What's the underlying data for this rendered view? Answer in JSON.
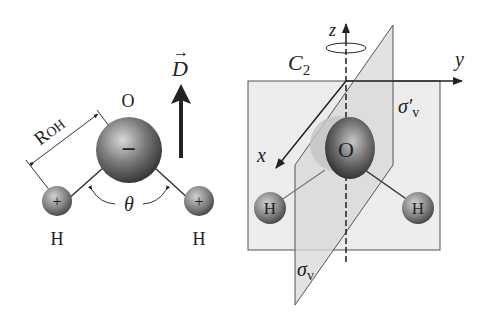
{
  "left_diagram": {
    "oxygen_label": "O",
    "oxygen_charge": "−",
    "hydrogen_left_label": "H",
    "hydrogen_right_label": "H",
    "hydrogen_charge": "+",
    "bond_length_label": "R",
    "bond_length_sub": "OH",
    "angle_label": "θ",
    "dipole_label": "D",
    "dipole_arrow": "→"
  },
  "right_diagram": {
    "axis_z": "z",
    "axis_y": "y",
    "axis_x": "x",
    "rotation_axis_label": "C",
    "rotation_axis_sub": "2",
    "plane_yz_label": "σ′",
    "plane_yz_sub": "v",
    "plane_xz_label": "σ",
    "plane_xz_sub": "v",
    "oxygen_label": "O",
    "hydrogen_left_label": "H",
    "hydrogen_right_label": "H"
  },
  "colors": {
    "plane_fill": "#e4e4e4",
    "plane_stroke": "#555555",
    "atom_dark": "#3a3a3a",
    "atom_light": "#b8b8b8",
    "ink": "#222222"
  }
}
